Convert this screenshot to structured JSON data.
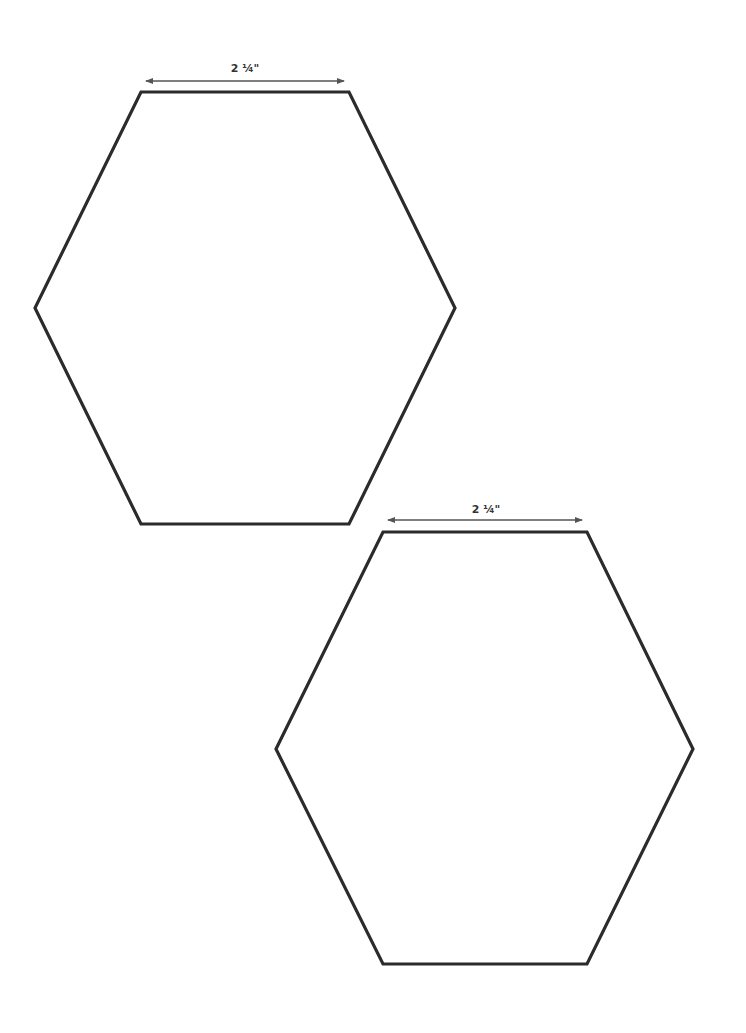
{
  "page": {
    "background": "#ffffff",
    "width": 746,
    "height": 1033
  },
  "style": {
    "outline_color": "#2b2b2b",
    "outline_width": 3.2,
    "arrow_color": "#555555",
    "label_color": "#333333"
  },
  "shapes": [
    {
      "name": "hexagon-template-top",
      "dimension_label": "2 ¼\"",
      "label_pos": {
        "x": 245,
        "y": 63
      },
      "arrow": {
        "x1": 146,
        "y1": 81,
        "x2": 344,
        "y2": 81
      },
      "points": [
        [
          141,
          92
        ],
        [
          349,
          92
        ],
        [
          455,
          308
        ],
        [
          349,
          524
        ],
        [
          141,
          524
        ],
        [
          35,
          308
        ]
      ]
    },
    {
      "name": "hexagon-template-bottom",
      "dimension_label": "2 ¼\"",
      "label_pos": {
        "x": 486,
        "y": 504
      },
      "arrow": {
        "x1": 388,
        "y1": 520,
        "x2": 582,
        "y2": 520
      },
      "points": [
        [
          383,
          532
        ],
        [
          587,
          532
        ],
        [
          693,
          749
        ],
        [
          587,
          964
        ],
        [
          383,
          964
        ],
        [
          276,
          749
        ]
      ]
    }
  ]
}
